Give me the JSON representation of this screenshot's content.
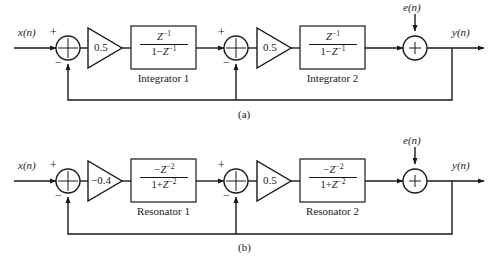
{
  "figure": {
    "type": "block-diagram",
    "line_color": "#1a1a1a",
    "background": "#ffffff"
  },
  "panels": [
    {
      "id": "a",
      "caption": "(a)",
      "input_label": "x(n)",
      "output_label": "y(n)",
      "noise_label": "e(n)",
      "summers": [
        {
          "id": "sum-a1",
          "plus_label": "+",
          "minus_label": "−",
          "inner_symbol": "cross"
        },
        {
          "id": "sum-a2",
          "plus_label": "+",
          "minus_label": "−",
          "inner_symbol": "cross"
        },
        {
          "id": "sum-a3",
          "plus_label": "+",
          "inner_symbol": "plus"
        }
      ],
      "gains": [
        {
          "id": "gain-a1",
          "label": "0.5"
        },
        {
          "id": "gain-a2",
          "label": "0.5"
        }
      ],
      "blocks": [
        {
          "id": "block-a1",
          "numerator": "Z",
          "numerator_exp": "−1",
          "denominator_lead": "1−",
          "denominator_var": "Z",
          "denominator_exp": "−1",
          "name": "Integrator 1"
        },
        {
          "id": "block-a2",
          "numerator": "Z",
          "numerator_exp": "−1",
          "denominator_lead": "1−",
          "denominator_var": "Z",
          "denominator_exp": "−1",
          "name": "Integrator 2"
        }
      ]
    },
    {
      "id": "b",
      "caption": "(b)",
      "input_label": "x(n)",
      "output_label": "y(n)",
      "noise_label": "e(n)",
      "summers": [
        {
          "id": "sum-b1",
          "plus_label": "+",
          "minus_label": "−",
          "inner_symbol": "cross"
        },
        {
          "id": "sum-b2",
          "plus_label": "+",
          "minus_label": "−",
          "inner_symbol": "cross"
        },
        {
          "id": "sum-b3",
          "plus_label": "+",
          "inner_symbol": "plus"
        }
      ],
      "gains": [
        {
          "id": "gain-b1",
          "label": "−0.4"
        },
        {
          "id": "gain-b2",
          "label": "0.5"
        }
      ],
      "blocks": [
        {
          "id": "block-b1",
          "numerator": "−Z",
          "numerator_exp": "−2",
          "denominator_lead": "1+",
          "denominator_var": "Z",
          "denominator_exp": "−2",
          "name": "Resonator 1"
        },
        {
          "id": "block-b2",
          "numerator": "−Z",
          "numerator_exp": "−2",
          "denominator_lead": "1+",
          "denominator_var": "Z",
          "denominator_exp": "−2",
          "name": "Resonator 2"
        }
      ]
    }
  ]
}
